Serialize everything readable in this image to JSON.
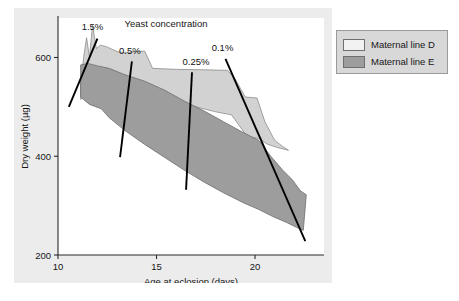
{
  "figure": {
    "background_color": "#ececed",
    "plot_background_color": "#ffffff"
  },
  "legend": {
    "position": "right",
    "background_color": "#d8d8d8",
    "items": [
      {
        "label": "Maternal line D",
        "color": "#f2f2f2"
      },
      {
        "label": "Maternal line E",
        "color": "#9d9d9d"
      }
    ]
  },
  "chart_data": {
    "type": "area",
    "title": "Yeast concentration",
    "xlabel": "Age at eclosion (days)",
    "ylabel": "Dry weight (µg)",
    "xlim": [
      10,
      23.5
    ],
    "ylim": [
      200,
      680
    ],
    "xticks": [
      10,
      15,
      20
    ],
    "yticks": [
      200,
      400,
      600
    ],
    "xticklabels": [
      "10",
      "15",
      "20"
    ],
    "yticklabels": [
      "200",
      "400",
      "600"
    ],
    "grid": false,
    "series": [
      {
        "name": "Maternal line D",
        "color": "#d2d2d2",
        "edge_color": "#8d8d8d",
        "band_upper": [
          [
            11.15,
            545
          ],
          [
            11.3,
            600
          ],
          [
            11.45,
            640
          ],
          [
            11.6,
            600
          ],
          [
            11.75,
            665
          ],
          [
            11.95,
            618
          ],
          [
            12.15,
            625
          ],
          [
            12.45,
            622
          ],
          [
            13.0,
            612
          ],
          [
            13.3,
            610
          ],
          [
            14.4,
            613
          ],
          [
            14.8,
            578
          ],
          [
            16.0,
            576
          ],
          [
            17.5,
            575
          ],
          [
            18.6,
            574
          ],
          [
            19.0,
            556
          ],
          [
            19.5,
            520
          ],
          [
            20.1,
            518
          ],
          [
            20.5,
            470
          ],
          [
            21.0,
            432
          ],
          [
            21.4,
            420
          ],
          [
            21.7,
            412
          ]
        ],
        "band_lower": [
          [
            11.15,
            515
          ],
          [
            11.6,
            530
          ],
          [
            12.2,
            560
          ],
          [
            12.6,
            558
          ],
          [
            13.4,
            552
          ],
          [
            14.4,
            546
          ],
          [
            14.9,
            530
          ],
          [
            16.0,
            512
          ],
          [
            17.0,
            500
          ],
          [
            18.0,
            490
          ],
          [
            18.8,
            484
          ],
          [
            19.2,
            462
          ],
          [
            19.6,
            440
          ],
          [
            20.2,
            436
          ],
          [
            20.6,
            425
          ],
          [
            21.1,
            418
          ],
          [
            21.7,
            412
          ]
        ]
      },
      {
        "name": "Maternal line E",
        "color": "#9d9d9d",
        "edge_color": "#6d6d6d",
        "band_upper": [
          [
            11.15,
            585
          ],
          [
            11.5,
            588
          ],
          [
            12.0,
            583
          ],
          [
            12.6,
            578
          ],
          [
            13.4,
            565
          ],
          [
            14.4,
            552
          ],
          [
            15.4,
            534
          ],
          [
            16.4,
            512
          ],
          [
            17.4,
            492
          ],
          [
            18.4,
            470
          ],
          [
            19.4,
            448
          ],
          [
            20.2,
            432
          ],
          [
            20.8,
            400
          ],
          [
            21.4,
            372
          ],
          [
            21.9,
            352
          ],
          [
            22.3,
            330
          ],
          [
            22.6,
            322
          ]
        ],
        "band_lower": [
          [
            11.15,
            520
          ],
          [
            11.6,
            505
          ],
          [
            12.2,
            496
          ],
          [
            12.6,
            478
          ],
          [
            13.4,
            452
          ],
          [
            14.4,
            424
          ],
          [
            15.4,
            398
          ],
          [
            16.4,
            372
          ],
          [
            17.4,
            348
          ],
          [
            18.4,
            326
          ],
          [
            19.4,
            306
          ],
          [
            20.2,
            292
          ],
          [
            20.9,
            278
          ],
          [
            21.6,
            266
          ],
          [
            22.1,
            256
          ],
          [
            22.45,
            250
          ],
          [
            22.6,
            322
          ]
        ]
      }
    ],
    "annotations": [
      {
        "label": "1.5%",
        "text_x": 11.75,
        "text_y": 655,
        "line_x1": 12.0,
        "line_y1": 638,
        "line_x2": 10.55,
        "line_y2": 500
      },
      {
        "label": "0.5%",
        "text_x": 13.65,
        "text_y": 608,
        "line_x1": 13.75,
        "line_y1": 592,
        "line_x2": 13.15,
        "line_y2": 398
      },
      {
        "label": "0.25%",
        "text_x": 17.0,
        "text_y": 585,
        "line_x1": 16.8,
        "line_y1": 570,
        "line_x2": 16.5,
        "line_y2": 332
      },
      {
        "label": "0.1%",
        "text_x": 18.35,
        "text_y": 613,
        "line_x1": 18.5,
        "line_y1": 597,
        "line_x2": 22.55,
        "line_y2": 228
      }
    ]
  }
}
